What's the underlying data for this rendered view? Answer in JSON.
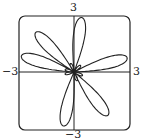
{
  "chart_data": {
    "type": "line",
    "subtype": "polar-curve",
    "title": "",
    "xlabel": "",
    "ylabel": "",
    "xlim": [
      -3,
      3
    ],
    "ylim": [
      -3,
      3
    ],
    "tick_labels": {
      "top": "3",
      "bottom": "−3",
      "left": "−3",
      "right": "3"
    },
    "petal_angles_deg": [
      15,
      82,
      134,
      163,
      259,
      308
    ],
    "large_petal_length": 3,
    "small_petal_length": 0.5,
    "grid": false
  },
  "labels": {
    "top": "3",
    "bottom": "−3",
    "left": "−3",
    "right": "3"
  }
}
